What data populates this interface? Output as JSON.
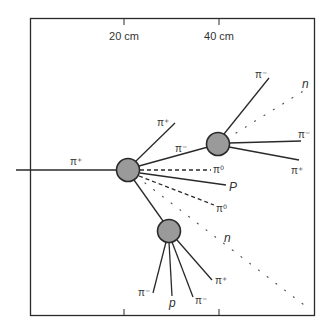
{
  "diagram": {
    "scale_ticks": [
      {
        "label": "20 cm",
        "x": 124
      },
      {
        "label": "40 cm",
        "x": 219
      }
    ],
    "vertices": [
      {
        "id": "v1",
        "x": 128,
        "y": 170,
        "r": 11
      },
      {
        "id": "v2",
        "x": 218,
        "y": 144,
        "r": 11
      },
      {
        "id": "v3",
        "x": 169,
        "y": 231,
        "r": 11
      }
    ],
    "tracks": {
      "incoming": {
        "label": "π⁺",
        "style": "solid"
      },
      "v1_pi_plus": {
        "label": "π⁺",
        "style": "solid"
      },
      "v1_pi_minus": {
        "label": "π⁻",
        "style": "solid"
      },
      "v1_pi0_a": {
        "label": "π⁰",
        "style": "dashed"
      },
      "v1_p": {
        "label": "P",
        "style": "solid"
      },
      "v1_pi0_b": {
        "label": "π⁰",
        "style": "dashed"
      },
      "v1_n": {
        "label": "n",
        "style": "dotted"
      },
      "v2_pi_minus_up": {
        "label": "π⁻",
        "style": "solid"
      },
      "v2_n": {
        "label": "n",
        "style": "dotted"
      },
      "v2_pi_minus": {
        "label": "π⁻",
        "style": "solid"
      },
      "v2_pi_plus": {
        "label": "π⁺",
        "style": "solid"
      },
      "v3_pi_minus_a": {
        "label": "π⁻",
        "style": "solid"
      },
      "v3_p": {
        "label": "p",
        "style": "solid"
      },
      "v3_pi_minus_b": {
        "label": "π⁻",
        "style": "solid"
      },
      "v3_pi_plus": {
        "label": "π⁺",
        "style": "solid"
      }
    },
    "colors": {
      "line": "#2a2a2a",
      "vertex_fill": "#9a9a9a",
      "text": "#333333"
    }
  }
}
